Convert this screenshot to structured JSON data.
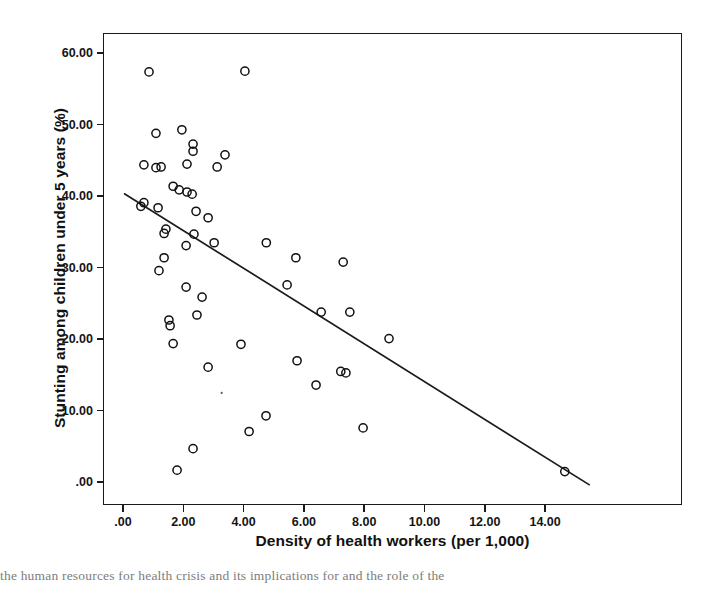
{
  "chart_data": {
    "type": "scatter",
    "title": "",
    "xlabel": "Density of health workers (per 1,000)",
    "ylabel": "Stunting among children under 5 years (%)",
    "xlim": [
      -0.76,
      18.4
    ],
    "ylim": [
      -3.2,
      63.8
    ],
    "grid": false,
    "legend": null,
    "marker": "open-circle",
    "xticks": [
      ".00",
      "2.00",
      "4.00",
      "6.00",
      "8.00",
      "10.00",
      "12.00",
      "14.00"
    ],
    "xtick_values": [
      0,
      2,
      4,
      6,
      8,
      10,
      12,
      14
    ],
    "yticks": [
      "60.00",
      "50.00",
      "40.00",
      "30.00",
      "20.00",
      "10.00",
      ".00"
    ],
    "ytick_values": [
      60,
      50,
      40,
      30,
      20,
      10,
      0
    ],
    "points": [
      {
        "x": 0.83,
        "y": 57.5
      },
      {
        "x": 4.01,
        "y": 57.6
      },
      {
        "x": 1.06,
        "y": 48.9
      },
      {
        "x": 1.92,
        "y": 49.4
      },
      {
        "x": 2.29,
        "y": 47.4
      },
      {
        "x": 2.29,
        "y": 46.4
      },
      {
        "x": 0.66,
        "y": 44.5
      },
      {
        "x": 1.06,
        "y": 44.1
      },
      {
        "x": 1.23,
        "y": 44.2
      },
      {
        "x": 2.09,
        "y": 44.6
      },
      {
        "x": 3.09,
        "y": 44.2
      },
      {
        "x": 3.35,
        "y": 45.9
      },
      {
        "x": 1.63,
        "y": 41.5
      },
      {
        "x": 1.83,
        "y": 41.0
      },
      {
        "x": 2.09,
        "y": 40.7
      },
      {
        "x": 2.26,
        "y": 40.4
      },
      {
        "x": 0.56,
        "y": 38.7
      },
      {
        "x": 0.66,
        "y": 39.2
      },
      {
        "x": 1.13,
        "y": 38.5
      },
      {
        "x": 2.39,
        "y": 38.0
      },
      {
        "x": 1.39,
        "y": 35.5
      },
      {
        "x": 1.33,
        "y": 34.9
      },
      {
        "x": 2.79,
        "y": 37.1
      },
      {
        "x": 2.32,
        "y": 34.8
      },
      {
        "x": 2.06,
        "y": 33.2
      },
      {
        "x": 2.99,
        "y": 33.6
      },
      {
        "x": 1.33,
        "y": 31.5
      },
      {
        "x": 1.16,
        "y": 29.7
      },
      {
        "x": 4.72,
        "y": 33.6
      },
      {
        "x": 5.7,
        "y": 31.5
      },
      {
        "x": 7.27,
        "y": 30.9
      },
      {
        "x": 5.41,
        "y": 27.7
      },
      {
        "x": 6.54,
        "y": 23.9
      },
      {
        "x": 7.49,
        "y": 23.9
      },
      {
        "x": 8.79,
        "y": 20.2
      },
      {
        "x": 2.06,
        "y": 27.4
      },
      {
        "x": 2.59,
        "y": 26.0
      },
      {
        "x": 2.42,
        "y": 23.5
      },
      {
        "x": 1.49,
        "y": 22.8
      },
      {
        "x": 1.53,
        "y": 22.0
      },
      {
        "x": 1.63,
        "y": 19.5
      },
      {
        "x": 3.88,
        "y": 19.4
      },
      {
        "x": 5.74,
        "y": 17.1
      },
      {
        "x": 7.19,
        "y": 15.6
      },
      {
        "x": 7.36,
        "y": 15.4
      },
      {
        "x": 6.37,
        "y": 13.7
      },
      {
        "x": 4.71,
        "y": 9.4
      },
      {
        "x": 4.15,
        "y": 7.2
      },
      {
        "x": 7.93,
        "y": 7.7
      },
      {
        "x": 2.79,
        "y": 16.2
      },
      {
        "x": 2.29,
        "y": 4.8
      },
      {
        "x": 1.76,
        "y": 1.8
      },
      {
        "x": 14.62,
        "y": 1.6
      }
    ],
    "fit_line": {
      "label": "linear-fit",
      "x_start": 0.0,
      "y_start": 40.5,
      "x_end": 15.45,
      "y_end": -0.3
    }
  },
  "artifacts": {
    "caption_bleed": "the human resources for health crisis and its implications for and the role of the"
  }
}
